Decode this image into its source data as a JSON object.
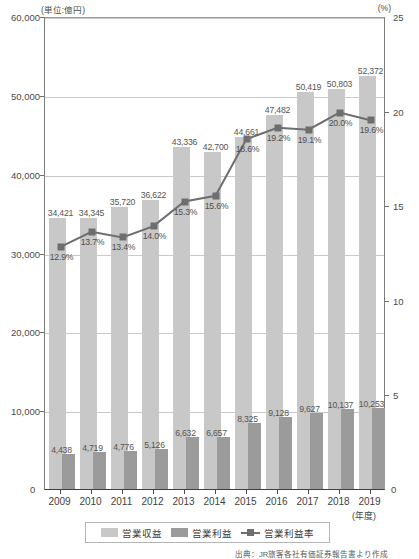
{
  "axes": {
    "left_unit": "(単位:億円)",
    "right_unit": "(%)",
    "x_unit": "(年度)",
    "left_ticks": [
      "0",
      "10,000",
      "20,000",
      "30,000",
      "40,000",
      "50,000",
      "60,000"
    ],
    "right_ticks": [
      "0",
      "5",
      "10",
      "15",
      "20",
      "25"
    ],
    "zero_left": "0",
    "zero_right": "0"
  },
  "legend": {
    "items": [
      {
        "label": "営業収益",
        "swatch": "revenue-swatch",
        "color": "#c8c8c8"
      },
      {
        "label": "営業利益",
        "swatch": "profit-swatch",
        "color": "#9b9b9b"
      },
      {
        "label": "営業利益率",
        "swatch": "margin-line-swatch",
        "color": "#6e6e6e"
      }
    ]
  },
  "source_note": "出典：JR旅客各社有価証券報告書より作成",
  "chart_data": {
    "type": "bar",
    "title": "",
    "subtitle": "",
    "xlabel": "(年度)",
    "ylabel": "(単位:億円)",
    "y2label": "(%)",
    "ylim": [
      0,
      60000
    ],
    "y2lim": [
      0,
      25
    ],
    "grid": true,
    "legend_position": "bottom",
    "categories": [
      "2009",
      "2010",
      "2011",
      "2012",
      "2013",
      "2014",
      "2015",
      "2016",
      "2017",
      "2018",
      "2019"
    ],
    "series": [
      {
        "name": "営業収益",
        "type": "bar",
        "axis": "left",
        "color": "#c8c8c8",
        "values": [
          34421,
          34345,
          35720,
          36622,
          43336,
          42700,
          44661,
          47482,
          50419,
          50803,
          52372
        ],
        "labels": [
          "34,421",
          "34,345",
          "35,720",
          "36,622",
          "43,336",
          "42,700",
          "44,661",
          "47,482",
          "50,419",
          "50,803",
          "52,372"
        ]
      },
      {
        "name": "営業利益",
        "type": "bar",
        "axis": "left",
        "color": "#9b9b9b",
        "values": [
          4438,
          4719,
          4776,
          5126,
          6632,
          6657,
          8325,
          9128,
          9627,
          10137,
          10253
        ],
        "labels": [
          "4,438",
          "4,719",
          "4,776",
          "5,126",
          "6,632",
          "6,657",
          "8,325",
          "9,128",
          "9,627",
          "10,137",
          "10,253"
        ]
      },
      {
        "name": "営業利益率",
        "type": "line",
        "axis": "right",
        "color": "#6e6e6e",
        "values": [
          12.9,
          13.7,
          13.4,
          14.0,
          15.3,
          15.6,
          18.6,
          19.2,
          19.1,
          20.0,
          19.6
        ],
        "labels": [
          "12.9%",
          "13.7%",
          "13.4%",
          "14.0%",
          "15.3%",
          "15.6%",
          "18.6%",
          "19.2%",
          "19.1%",
          "20.0%",
          "19.6%"
        ]
      }
    ]
  }
}
